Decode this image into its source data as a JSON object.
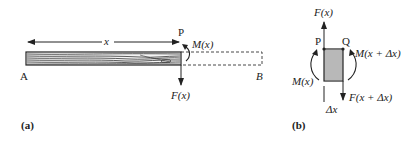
{
  "figure_a": {
    "length_label": "x",
    "point_p": "P",
    "point_a": "A",
    "point_b": "B",
    "moment_label": "M(x)",
    "force_label": "F(x)",
    "caption": "(a)"
  },
  "figure_b": {
    "force_top_label": "F(x)",
    "point_p": "P",
    "point_q": "Q",
    "moment_right_label": "M(x + Δx)",
    "moment_left_label": "M(x)",
    "force_bottom_label": "F(x + Δx)",
    "width_label": "Δx",
    "caption": "(b)"
  },
  "colors": {
    "ink": "#222222",
    "dashed": "#333333",
    "background": "#ffffff"
  }
}
